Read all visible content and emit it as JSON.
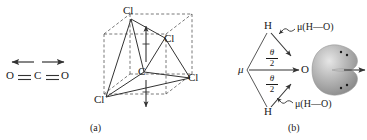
{
  "figure": {
    "background_color": "#ffffff",
    "line_color": "#3a3a3a",
    "text_color": "#1a1a1a",
    "orbital_color": "#9a9a9a"
  },
  "panel_co2": {
    "name": "carbon-dioxide-dipole",
    "atoms": {
      "left_oxygen": "O",
      "carbon": "C",
      "right_oxygen": "O"
    },
    "bonds": {
      "left_bond": "double",
      "right_bond": "double"
    },
    "dipole_arrows": [
      {
        "label": "left-dipole-arrow",
        "direction": "left"
      },
      {
        "label": "right-dipole-arrow",
        "direction": "right"
      }
    ]
  },
  "panel_a": {
    "caption": "(a)",
    "name": "carbon-tetrachloride-cube",
    "center_atom": "C",
    "chlorine_labels": [
      "Cl",
      "Cl",
      "Cl",
      "Cl"
    ],
    "chlorine_top_label": "Cl",
    "chlorine_upper_right_label": "Cl",
    "chlorine_lower_left_label": "Cl",
    "chlorine_right_label": "Cl",
    "dipole_arrows": [
      {
        "label": "up-dipole-arrow",
        "direction": "up"
      },
      {
        "label": "down-dipole-arrow",
        "direction": "down"
      }
    ]
  },
  "panel_b": {
    "caption": "(b)",
    "name": "water-dipole",
    "atoms": {
      "hydrogen_top": "H",
      "hydrogen_bottom": "H",
      "oxygen": "O"
    },
    "resultant_label": "μ",
    "angle_label_numerator": "θ",
    "angle_label_denominator": "2",
    "bond_dipole_top": "μ(H—O)",
    "bond_dipole_bottom": "μ(H—O)",
    "lone_pairs": 2,
    "lone_pair_dots_per_lobe": 2,
    "net_dipole_arrow": "net-dipole-arrow"
  }
}
